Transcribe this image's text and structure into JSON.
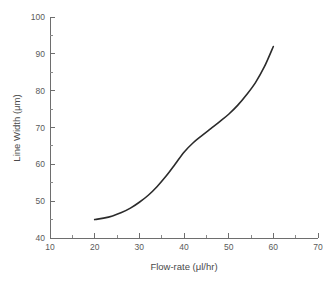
{
  "figure": {
    "background_color": "#ffffff",
    "axis_color": "#6e6e6e",
    "curve_color": "#2b2b2b",
    "text_color": "#4a4a4a"
  },
  "chart_data": {
    "type": "line",
    "title": "",
    "xlabel": "Flow-rate (μl/hr)",
    "ylabel": "Line Width (μm)",
    "xlim": [
      10,
      70
    ],
    "ylim": [
      40,
      100
    ],
    "xticks": [
      10,
      20,
      30,
      40,
      50,
      60,
      70
    ],
    "xtick_labels": [
      "10",
      "20",
      "30",
      "40",
      "50",
      "60",
      "70"
    ],
    "xticks_minor": [
      15,
      25,
      35,
      45,
      55,
      65
    ],
    "yticks": [
      40,
      50,
      60,
      70,
      80,
      90,
      100
    ],
    "ytick_labels": [
      "40",
      "50",
      "60",
      "70",
      "80",
      "90",
      "100"
    ],
    "yticks_minor": [
      45,
      55,
      65,
      75,
      85,
      95
    ],
    "grid": false,
    "legend": false,
    "legend_position": "none",
    "series": [
      {
        "name": "Line Width vs Flow-rate",
        "x": [
          20,
          22,
          24,
          26,
          28,
          30,
          32,
          34,
          36,
          38,
          40,
          42,
          44,
          46,
          48,
          50,
          52,
          54,
          56,
          58,
          60
        ],
        "y": [
          45.0,
          45.4,
          46.0,
          46.9,
          48.1,
          49.7,
          51.6,
          54.0,
          56.8,
          60.0,
          63.3,
          65.8,
          67.8,
          69.7,
          71.6,
          73.6,
          76.0,
          78.9,
          82.2,
          86.5,
          92.0
        ]
      }
    ]
  }
}
